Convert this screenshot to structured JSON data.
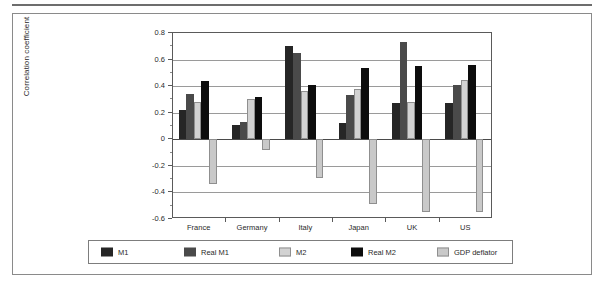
{
  "chart_data": {
    "type": "bar",
    "title": "",
    "subtitle": "",
    "xlabel": "",
    "ylabel": "Correlation coefficient",
    "ylim": [
      -0.6,
      0.8
    ],
    "ytick_labels": [
      "0.8",
      "0.6",
      "0.4",
      "0.2",
      "0",
      "-0.2",
      "-0.4",
      "-0.6"
    ],
    "ytick_values": [
      0.8,
      0.6,
      0.4,
      0.2,
      0,
      -0.2,
      -0.4,
      -0.6
    ],
    "grid": true,
    "legend_position": "bottom",
    "categories": [
      "France",
      "Germany",
      "Italy",
      "Japan",
      "UK",
      "US"
    ],
    "series": [
      {
        "name": "M1",
        "color": "#262626",
        "values": [
          0.22,
          0.11,
          0.7,
          0.12,
          0.27,
          0.27
        ]
      },
      {
        "name": "Real M1",
        "color": "#4a4a4a",
        "values": [
          0.34,
          0.13,
          0.65,
          0.33,
          0.73,
          0.41
        ]
      },
      {
        "name": "M2",
        "color": "#d2d2d2",
        "values": [
          0.28,
          0.3,
          0.36,
          0.38,
          0.28,
          0.45
        ]
      },
      {
        "name": "Real M2",
        "color": "#0d0d0d",
        "values": [
          0.44,
          0.32,
          0.41,
          0.54,
          0.55,
          0.56
        ]
      },
      {
        "name": "GDP deflator",
        "color": "#c9c9c9",
        "values": [
          -0.34,
          -0.08,
          -0.29,
          -0.49,
          -0.55,
          -0.55
        ]
      }
    ]
  },
  "legend": {
    "entries": [
      {
        "label": "M1",
        "color": "#262626"
      },
      {
        "label": "Real M1",
        "color": "#4a4a4a"
      },
      {
        "label": "M2",
        "color": "#d2d2d2"
      },
      {
        "label": "Real M2",
        "color": "#0d0d0d"
      },
      {
        "label": "GDP deflator",
        "color": "#c9c9c9"
      }
    ]
  }
}
